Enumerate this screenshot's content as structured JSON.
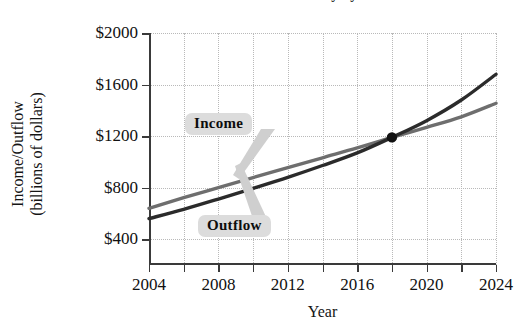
{
  "chart_data": {
    "type": "line",
    "title": "Cash Flow of the Social Security System",
    "xlabel": "Year",
    "ylabel": "Income/Outflow\n(billions of dollars)",
    "ylabel_line1": "Income/Outflow",
    "ylabel_line2": "(billions of dollars)",
    "xlim": [
      2004,
      2024
    ],
    "ylim": [
      200,
      2000
    ],
    "x_ticks": [
      2004,
      2008,
      2012,
      2016,
      2020,
      2024
    ],
    "x_minor_ticks": [
      2006,
      2010,
      2014,
      2018,
      2022
    ],
    "y_ticks": [
      400,
      800,
      1200,
      1600,
      2000
    ],
    "y_tick_labels": [
      "$400",
      "$800",
      "$1200",
      "$1600",
      "$2000"
    ],
    "grid": true,
    "legend_position": "inline-callouts",
    "series": [
      {
        "name": "Income",
        "color": "#6e6e6e",
        "points": [
          {
            "x": 2004,
            "y": 640
          },
          {
            "x": 2006,
            "y": 722
          },
          {
            "x": 2008,
            "y": 800
          },
          {
            "x": 2010,
            "y": 878
          },
          {
            "x": 2012,
            "y": 955
          },
          {
            "x": 2014,
            "y": 1032
          },
          {
            "x": 2016,
            "y": 1108
          },
          {
            "x": 2018,
            "y": 1190
          },
          {
            "x": 2020,
            "y": 1268
          },
          {
            "x": 2022,
            "y": 1350
          },
          {
            "x": 2024,
            "y": 1455
          }
        ]
      },
      {
        "name": "Outflow",
        "color": "#2b2b2b",
        "points": [
          {
            "x": 2004,
            "y": 560
          },
          {
            "x": 2006,
            "y": 632
          },
          {
            "x": 2008,
            "y": 712
          },
          {
            "x": 2010,
            "y": 795
          },
          {
            "x": 2012,
            "y": 880
          },
          {
            "x": 2014,
            "y": 972
          },
          {
            "x": 2016,
            "y": 1070
          },
          {
            "x": 2018,
            "y": 1190
          },
          {
            "x": 2020,
            "y": 1320
          },
          {
            "x": 2022,
            "y": 1480
          },
          {
            "x": 2024,
            "y": 1680
          }
        ]
      }
    ],
    "annotations": [
      {
        "name": "crossover-point",
        "x": 2018,
        "y": 1190,
        "marker": "filled-circle"
      }
    ],
    "labels": {
      "income": "Income",
      "outflow": "Outflow"
    }
  }
}
